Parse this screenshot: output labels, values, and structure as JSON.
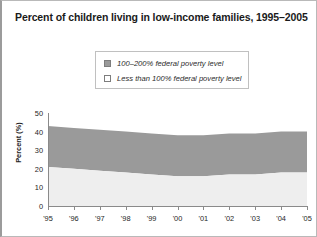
{
  "chart_data": {
    "type": "area",
    "title": "Percent of children living in low-income families, 1995–2005",
    "xlabel": "",
    "ylabel": "Percent (%)",
    "ylim": [
      0,
      50
    ],
    "yticks": [
      0,
      10,
      20,
      30,
      40,
      50
    ],
    "grid": false,
    "stacked": true,
    "legend_position": "top-center",
    "categories": [
      "'95",
      "'96",
      "'97",
      "'98",
      "'99",
      "'00",
      "'01",
      "'02",
      "'03",
      "'04",
      "'05"
    ],
    "x_full": [
      1995,
      1996,
      1997,
      1998,
      1999,
      2000,
      2001,
      2002,
      2003,
      2004,
      2005
    ],
    "series": [
      {
        "name": "Less than 100% federal poverty level",
        "color": "#eeeeee",
        "values": [
          21,
          20,
          19,
          18,
          17,
          16,
          16,
          17,
          17,
          18,
          18
        ]
      },
      {
        "name": "100–200% federal poverty level",
        "color": "#9a9a9a",
        "values": [
          22,
          22,
          22,
          22,
          22,
          22,
          22,
          22,
          22,
          22,
          22
        ]
      }
    ],
    "cumulative_top": [
      43,
      42,
      41,
      40,
      39,
      38,
      38,
      39,
      39,
      40,
      40
    ],
    "annotations": []
  },
  "legend": {
    "items": [
      {
        "label": "100–200% federal poverty level",
        "swatch": "#9a9a9a"
      },
      {
        "label": "Less than 100% federal poverty level",
        "swatch": "#ffffff"
      }
    ]
  },
  "axis": {
    "y_labels": [
      "50",
      "40",
      "30",
      "20",
      "10",
      "0"
    ],
    "x_labels": [
      "'95",
      "'96",
      "'97",
      "'98",
      "'99",
      "'00",
      "'01",
      "'02",
      "'03",
      "'04",
      "'05"
    ]
  },
  "colors": {
    "band_upper": "#9a9a9a",
    "band_lower": "#eeeeee",
    "axis": "#8a8a8a",
    "text": "#1e1e1e",
    "frame": "#b9b9b9"
  }
}
